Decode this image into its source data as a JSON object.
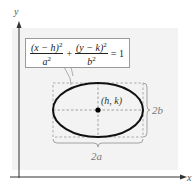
{
  "figure": {
    "type": "ellipse-diagram",
    "axes": {
      "x_label": "x",
      "y_label": "y"
    },
    "equation": {
      "term1_numerator": "(x − h)",
      "term1_denominator": "a",
      "term2_numerator": "(y − k)",
      "term2_denominator": "b",
      "exponent": "2",
      "plus": "+",
      "equals": "= 1"
    },
    "center_label": "(h, k)",
    "vertical_extent_label": "2b",
    "horizontal_extent_label": "2a",
    "colors": {
      "panel": "#f3f3f3",
      "ellipse": "#111111",
      "dashed": "#9a9a9a",
      "axis": "#333333",
      "label": "#555555"
    }
  }
}
